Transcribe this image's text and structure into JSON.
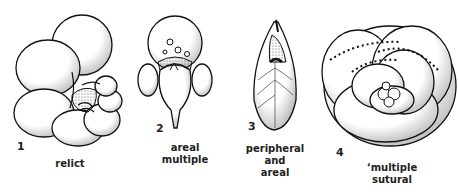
{
  "figures": [
    {
      "number": "1",
      "caption": "relict"
    },
    {
      "number": "2",
      "caption_line1": "areal",
      "caption_line2": "multiple"
    },
    {
      "number": "3",
      "caption_line1": "peripheral and",
      "caption_line2": "areal"
    },
    {
      "number": "4",
      "caption_line1": "‘multiple",
      "caption_line2": "sutural"
    }
  ],
  "colors": {
    "ink": "#111111",
    "background": "#ffffff",
    "stipple": "#555555"
  }
}
